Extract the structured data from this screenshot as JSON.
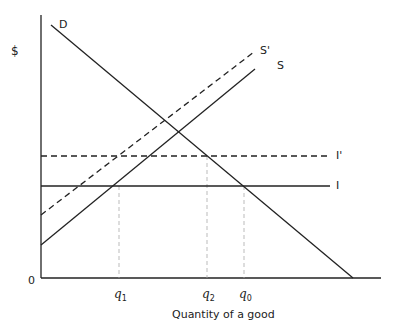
{
  "diagram": {
    "y_axis_label": "$",
    "x_axis_label": "Quantity of a good",
    "origin_label": "0",
    "curves": {
      "demand": {
        "label": "D",
        "style": "solid"
      },
      "supply": {
        "label": "S",
        "style": "solid"
      },
      "supply_shifted": {
        "label": "S'",
        "style": "dashed"
      },
      "price_line": {
        "label": "I",
        "style": "solid"
      },
      "price_line_shifted": {
        "label": "I'",
        "style": "dashed"
      }
    },
    "quantity_markers": [
      {
        "base": "q",
        "sub": "1"
      },
      {
        "base": "q",
        "sub": "2"
      },
      {
        "base": "q",
        "sub": "0"
      }
    ]
  },
  "colors": {
    "line": "#222222",
    "guide": "#aaaaaa"
  }
}
